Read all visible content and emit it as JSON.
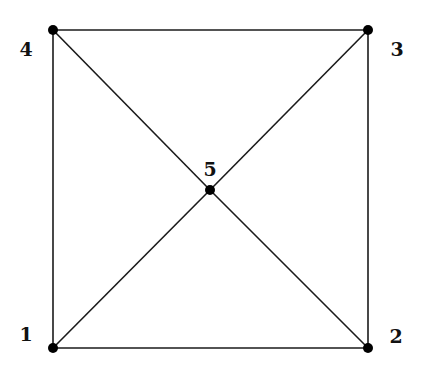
{
  "graph": {
    "nodes": [
      {
        "id": "1",
        "label": "1",
        "x": 53,
        "y": 348,
        "lx": 26,
        "ly": 341
      },
      {
        "id": "2",
        "label": "2",
        "x": 368,
        "y": 348,
        "lx": 396,
        "ly": 343
      },
      {
        "id": "3",
        "label": "3",
        "x": 368,
        "y": 30,
        "lx": 397,
        "ly": 56
      },
      {
        "id": "4",
        "label": "4",
        "x": 53,
        "y": 30,
        "lx": 26,
        "ly": 56
      },
      {
        "id": "5",
        "label": "5",
        "x": 210,
        "y": 190,
        "lx": 210,
        "ly": 176
      }
    ],
    "edges": [
      [
        "1",
        "2"
      ],
      [
        "2",
        "3"
      ],
      [
        "3",
        "4"
      ],
      [
        "4",
        "1"
      ],
      [
        "1",
        "5"
      ],
      [
        "5",
        "3"
      ],
      [
        "4",
        "5"
      ],
      [
        "5",
        "2"
      ]
    ]
  }
}
